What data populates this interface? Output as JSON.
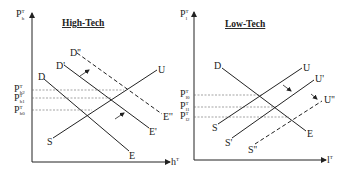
{
  "panels": [
    {
      "id": "high-tech",
      "title": "High-Tech",
      "y_axis_label": "P",
      "y_axis_sup": "T",
      "y_axis_sub": "h",
      "x_axis_label": "h",
      "x_axis_sup": "T",
      "price_levels": [
        {
          "label": "P",
          "sup": "T",
          "sub": "h2"
        },
        {
          "label": "P",
          "sup": "T",
          "sub": "h1"
        },
        {
          "label": "P",
          "sup": "T",
          "sub": "h0"
        }
      ],
      "curves": [
        {
          "name": "D-E",
          "start_label": "D",
          "end_label": "E",
          "style": "solid"
        },
        {
          "name": "D'-E'",
          "start_label": "D'",
          "end_label": "E'",
          "style": "solid"
        },
        {
          "name": "D''-E''",
          "start_label": "D''",
          "end_label": "E''",
          "style": "dashed"
        },
        {
          "name": "S-U",
          "start_label": "S",
          "end_label": "U",
          "style": "solid"
        }
      ],
      "shift_arrows": 2
    },
    {
      "id": "low-tech",
      "title": "Low-Tech",
      "y_axis_label": "P",
      "y_axis_sup": "T",
      "y_axis_sub": "l",
      "x_axis_label": "l",
      "x_axis_sup": "T",
      "price_levels": [
        {
          "label": "P",
          "sup": "T",
          "sub": "l0"
        },
        {
          "label": "P",
          "sup": "T",
          "sub": "l1"
        },
        {
          "label": "P",
          "sup": "T",
          "sub": "l2"
        }
      ],
      "curves": [
        {
          "name": "D-E",
          "start_label": "D",
          "end_label": "E",
          "style": "solid"
        },
        {
          "name": "S-U",
          "start_label": "S",
          "end_label": "U",
          "style": "solid"
        },
        {
          "name": "S'-U'",
          "start_label": "S'",
          "end_label": "U'",
          "style": "solid"
        },
        {
          "name": "S''-U''",
          "start_label": "S''",
          "end_label": "U''",
          "style": "dashed"
        }
      ],
      "shift_arrows": 2
    }
  ]
}
